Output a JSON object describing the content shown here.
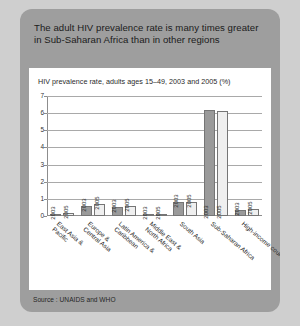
{
  "card": {
    "title": "The adult HIV prevalence rate is many times greater in Sub-Saharan Africa than in other regions",
    "source": "Source : UNAIDS and WHO",
    "background_color": "#9e9e9e",
    "panel_color": "#ffffff"
  },
  "chart_data": {
    "type": "bar",
    "title": "HIV prevalence rate, adults ages 15–49, 2003 and 2005 (%)",
    "xlabel": "",
    "ylabel": "",
    "ylim": [
      0,
      7
    ],
    "yticks": [
      0,
      1,
      2,
      3,
      4,
      5,
      6,
      7
    ],
    "ytick_labels": [
      "0",
      "1",
      "2",
      "3",
      "4",
      "5",
      "6",
      "7"
    ],
    "grid": true,
    "legend": "none",
    "series_colors": {
      "2003": "#9a9a9a",
      "2005": "#efefef"
    },
    "categories": [
      "East Asia &\nPacific",
      "Europe &\nCentral Asia",
      "Latin America &\nCaribbean",
      "Middle East &\nNorth Africa",
      "South Asia",
      "Sub-Saharan Africa",
      "High-income countries"
    ],
    "series": [
      {
        "name": "2003",
        "values": [
          0.1,
          0.6,
          0.55,
          0.1,
          0.8,
          6.2,
          0.35
        ]
      },
      {
        "name": "2005",
        "values": [
          0.15,
          0.7,
          0.6,
          0.1,
          0.8,
          6.1,
          0.4
        ]
      }
    ],
    "bar_labels": [
      "2003",
      "2005"
    ]
  }
}
